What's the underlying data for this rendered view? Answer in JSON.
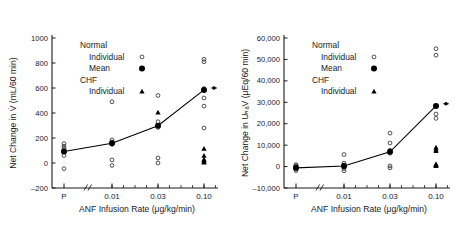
{
  "figure": {
    "panels": [
      {
        "id": "left-panel",
        "ylabel": "Net Change in V̇ (mL/60 min)",
        "xlabel": "ANF Infusion Rate (μg/kg/min)",
        "yticks": [
          "1000",
          "800",
          "600",
          "400",
          "200",
          "0",
          "–200"
        ],
        "xticks": [
          "P",
          "0.01",
          "0.03",
          "0.10"
        ],
        "legend": {
          "group1": "Normal",
          "group1_item1": "Individual",
          "group1_item2": "Mean",
          "group2": "CHF",
          "group2_item1": "Individual"
        }
      },
      {
        "id": "right-panel",
        "ylabel": "Net Change in UₙₐV (μEq/60 min)",
        "xlabel": "ANF Infusion Rate (μg/kg/min)",
        "yticks": [
          "60,000",
          "50,000",
          "40,000",
          "30,000",
          "20,000",
          "10,000",
          "0",
          "–10,000"
        ],
        "xticks": [
          "P",
          "0.01",
          "0.03",
          "0.10"
        ],
        "legend": {
          "group1": "Normal",
          "group1_item1": "Individual",
          "group1_item2": "Mean",
          "group2": "CHF",
          "group2_item1": "Individual"
        }
      }
    ]
  },
  "colors": {
    "axis": "#1a1a1a",
    "marker_open": "#333333",
    "marker_filled": "#000000",
    "line": "#000000"
  },
  "chart_data": [
    {
      "type": "scatter",
      "title": "",
      "xlabel": "ANF Infusion Rate (μg/kg/min)",
      "ylabel": "Net Change in V̇ (mL/60 min)",
      "categories": [
        "P",
        "0.01",
        "0.03",
        "0.10"
      ],
      "ylim": [
        -200,
        1000
      ],
      "yticks": [
        -200,
        0,
        200,
        400,
        600,
        800,
        1000
      ],
      "grid": false,
      "legend_position": "upper-left-inside",
      "series": [
        {
          "name": "Normal Individual",
          "marker": "open-circle",
          "points": [
            {
              "x": "P",
              "y": 155
            },
            {
              "x": "P",
              "y": 135
            },
            {
              "x": "P",
              "y": 118
            },
            {
              "x": "P",
              "y": 100
            },
            {
              "x": "P",
              "y": 60
            },
            {
              "x": "P",
              "y": -45
            },
            {
              "x": "0.01",
              "y": 490
            },
            {
              "x": "0.01",
              "y": 185
            },
            {
              "x": "0.01",
              "y": 168
            },
            {
              "x": "0.01",
              "y": 150
            },
            {
              "x": "0.01",
              "y": 25
            },
            {
              "x": "0.01",
              "y": -20
            },
            {
              "x": "0.03",
              "y": 540
            },
            {
              "x": "0.03",
              "y": 330
            },
            {
              "x": "0.03",
              "y": 300
            },
            {
              "x": "0.03",
              "y": 285
            },
            {
              "x": "0.03",
              "y": 40
            },
            {
              "x": "0.03",
              "y": 0
            },
            {
              "x": "0.10",
              "y": 830
            },
            {
              "x": "0.10",
              "y": 810
            },
            {
              "x": "0.10",
              "y": 595
            },
            {
              "x": "0.10",
              "y": 520
            },
            {
              "x": "0.10",
              "y": 455
            },
            {
              "x": "0.10",
              "y": 280
            }
          ]
        },
        {
          "name": "Normal Mean",
          "marker": "filled-circle",
          "connected": true,
          "points": [
            {
              "x": "P",
              "y": 92
            },
            {
              "x": "0.01",
              "y": 158
            },
            {
              "x": "0.03",
              "y": 298
            },
            {
              "x": "0.10",
              "y": 585
            }
          ]
        },
        {
          "name": "CHF Individual",
          "marker": "filled-triangle",
          "points": [
            {
              "x": "0.03",
              "y": 405
            },
            {
              "x": "0.10",
              "y": 115
            },
            {
              "x": "0.10",
              "y": 60
            },
            {
              "x": "0.10",
              "y": 30
            },
            {
              "x": "0.10",
              "y": 22
            },
            {
              "x": "0.10",
              "y": 12
            },
            {
              "x": "0.10",
              "y": 5
            }
          ]
        },
        {
          "name": "Mean end marker",
          "marker": "star",
          "points": [
            {
              "x": "0.10+",
              "y": 600
            }
          ]
        }
      ]
    },
    {
      "type": "scatter",
      "title": "",
      "xlabel": "ANF Infusion Rate (μg/kg/min)",
      "ylabel": "Net Change in UₙₐV (μEq/60 min)",
      "categories": [
        "P",
        "0.01",
        "0.03",
        "0.10"
      ],
      "ylim": [
        -10000,
        60000
      ],
      "yticks": [
        -10000,
        0,
        10000,
        20000,
        30000,
        40000,
        50000,
        60000
      ],
      "grid": false,
      "legend_position": "upper-left-inside",
      "series": [
        {
          "name": "Normal Individual",
          "marker": "open-circle",
          "points": [
            {
              "x": "P",
              "y": 900
            },
            {
              "x": "P",
              "y": 400
            },
            {
              "x": "P",
              "y": 0
            },
            {
              "x": "P",
              "y": -500
            },
            {
              "x": "P",
              "y": -1200
            },
            {
              "x": "P",
              "y": -1900
            },
            {
              "x": "0.01",
              "y": 5600
            },
            {
              "x": "0.01",
              "y": 1600
            },
            {
              "x": "0.01",
              "y": 700
            },
            {
              "x": "0.01",
              "y": 0
            },
            {
              "x": "0.01",
              "y": -900
            },
            {
              "x": "0.01",
              "y": -2000
            },
            {
              "x": "0.03",
              "y": 15600
            },
            {
              "x": "0.03",
              "y": 11000
            },
            {
              "x": "0.03",
              "y": 7600
            },
            {
              "x": "0.03",
              "y": 6200
            },
            {
              "x": "0.03",
              "y": 300
            },
            {
              "x": "0.03",
              "y": -600
            },
            {
              "x": "0.10",
              "y": 55000
            },
            {
              "x": "0.10",
              "y": 52000
            },
            {
              "x": "0.10",
              "y": 24500
            },
            {
              "x": "0.10",
              "y": 22500
            }
          ]
        },
        {
          "name": "Normal Mean",
          "marker": "filled-circle",
          "connected": true,
          "points": [
            {
              "x": "P",
              "y": -600
            },
            {
              "x": "0.01",
              "y": 300
            },
            {
              "x": "0.03",
              "y": 6900
            },
            {
              "x": "0.10",
              "y": 28300
            }
          ]
        },
        {
          "name": "CHF Individual",
          "marker": "filled-triangle",
          "points": [
            {
              "x": "0.10",
              "y": 9000
            },
            {
              "x": "0.10",
              "y": 8100
            },
            {
              "x": "0.10",
              "y": 7400
            },
            {
              "x": "0.10",
              "y": 1200
            },
            {
              "x": "0.10",
              "y": 900
            },
            {
              "x": "0.10",
              "y": 700
            },
            {
              "x": "0.10",
              "y": 400
            }
          ]
        },
        {
          "name": "Mean end marker",
          "marker": "star",
          "points": [
            {
              "x": "0.10+",
              "y": 29300
            }
          ]
        }
      ]
    }
  ]
}
